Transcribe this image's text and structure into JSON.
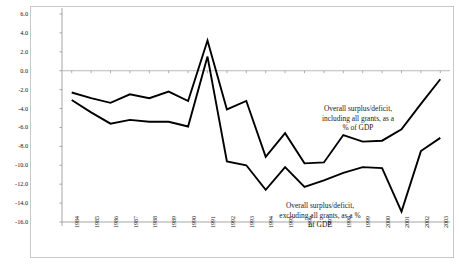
{
  "chart_data": {
    "type": "line",
    "title": "",
    "xlabel": "",
    "ylabel": "",
    "ylim": [
      -16.0,
      6.0
    ],
    "ytick_step": 2.0,
    "grid": false,
    "zero_line": true,
    "legend_position": "inline-annotations",
    "categories": [
      "1984",
      "1985",
      "1986",
      "1987",
      "1988",
      "1989",
      "1990",
      "1991",
      "1992",
      "1993",
      "1994",
      "1995",
      "1996",
      "1997",
      "1998",
      "1999",
      "2000",
      "2001",
      "2002",
      "2003"
    ],
    "ytick_labels": [
      "6.0",
      "4.0",
      "2.0",
      "0.0",
      "-2.0",
      "-4.0",
      "-6.0",
      "-8.0",
      "-10.0",
      "-12.0",
      "-14.0",
      "-16.0"
    ],
    "ytick_values": [
      6.0,
      4.0,
      2.0,
      0.0,
      -2.0,
      -4.0,
      -6.0,
      -8.0,
      -10.0,
      -12.0,
      -14.0,
      -16.0
    ],
    "series": [
      {
        "name": "Overall surplus/deficit, including all grants, as a % of GDP",
        "color": "#000000",
        "values": [
          -2.3,
          -2.9,
          -3.4,
          -2.5,
          -2.9,
          -2.2,
          -3.2,
          3.2,
          -4.1,
          -3.2,
          -9.1,
          -6.6,
          -9.8,
          -9.7,
          -6.8,
          -7.5,
          -7.4,
          -6.2,
          -3.5,
          -0.9
        ]
      },
      {
        "name": "Overall surplus/deficit, excluding all grants, as a % of GDP",
        "color": "#000000",
        "values": [
          -3.1,
          -4.4,
          -5.6,
          -5.2,
          -5.4,
          -5.4,
          -5.9,
          1.5,
          -9.6,
          -10.0,
          -12.6,
          -10.2,
          -12.3,
          -11.6,
          -10.8,
          -10.2,
          -10.3,
          -14.9,
          -8.5,
          -7.1
        ]
      }
    ],
    "annotations": [
      {
        "id": "including",
        "text": "Overall surplus/deficit,\ninclude_placeholder"
      }
    ]
  },
  "annotations": {
    "including": "Overall surplus/deficit,\nincluding all grants, as a\n% of GDP",
    "excluding": "Overall surplus/deficit,\nexcluding all grants, as a %\nof GDP"
  },
  "style": {
    "line_color": "#000000",
    "frame_color": "#c8c8c8",
    "zero_line_color": "#a8a8a8",
    "tick_color": "#909090",
    "background": "#ffffff"
  }
}
